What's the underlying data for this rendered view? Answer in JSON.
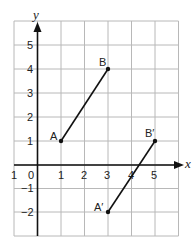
{
  "diagram": {
    "type": "coordinate-plane-translation",
    "axes": {
      "x_label": "x",
      "y_label": "y",
      "origin_label": "0",
      "x_ticks": [
        {
          "value": -1,
          "label": "1"
        },
        {
          "value": 1,
          "label": "1"
        },
        {
          "value": 2,
          "label": "2"
        },
        {
          "value": 3,
          "label": "3"
        },
        {
          "value": 4,
          "label": "4"
        },
        {
          "value": 5,
          "label": "5"
        }
      ],
      "y_ticks": [
        {
          "value": 5,
          "label": "5"
        },
        {
          "value": 4,
          "label": "4"
        },
        {
          "value": 3,
          "label": "3"
        },
        {
          "value": 2,
          "label": "2"
        },
        {
          "value": 1,
          "label": "1"
        },
        {
          "value": -1,
          "label": "−1"
        },
        {
          "value": -2,
          "label": "−2"
        }
      ],
      "x_range": [
        -1,
        6
      ],
      "y_range": [
        -3,
        6
      ]
    },
    "points": [
      {
        "name": "A",
        "label": "A",
        "x": 1,
        "y": 1
      },
      {
        "name": "B",
        "label": "B",
        "x": 3,
        "y": 4
      },
      {
        "name": "A-prime",
        "label": "A′",
        "x": 3,
        "y": -2
      },
      {
        "name": "B-prime",
        "label": "B′",
        "x": 5,
        "y": 1
      }
    ],
    "segments": [
      {
        "name": "segment-AB",
        "from": "A",
        "to": "B"
      },
      {
        "name": "segment-A-prime-B-prime",
        "from": "A-prime",
        "to": "B-prime"
      }
    ],
    "colors": {
      "grid": "#b8b8b8",
      "axis": "#111111",
      "background": "#ffffff"
    }
  }
}
